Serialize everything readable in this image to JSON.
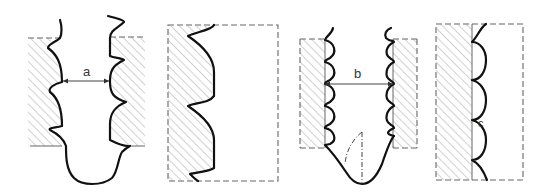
{
  "diagram": {
    "type": "technical-cross-section",
    "panels": [
      {
        "id": "panel-1",
        "description": "Threaded bore profile with widened base, dimension a between thread crests",
        "label": "a"
      },
      {
        "id": "panel-2",
        "description": "Detail of rounded thread profile against hatched material within dashed boundary",
        "label": ""
      },
      {
        "id": "panel-3",
        "description": "Scalloped (arc) thread profile bore with U-shaped base and dash-dot centerline, dimension b",
        "label": "b"
      },
      {
        "id": "panel-4",
        "description": "Detail of scalloped arc profile with cusp point c inside dashed boundary",
        "label": "c"
      }
    ],
    "colors": {
      "line": "#111111",
      "hatch": "#9a9a9a",
      "dashed": "#666666",
      "background": "#ffffff"
    }
  }
}
